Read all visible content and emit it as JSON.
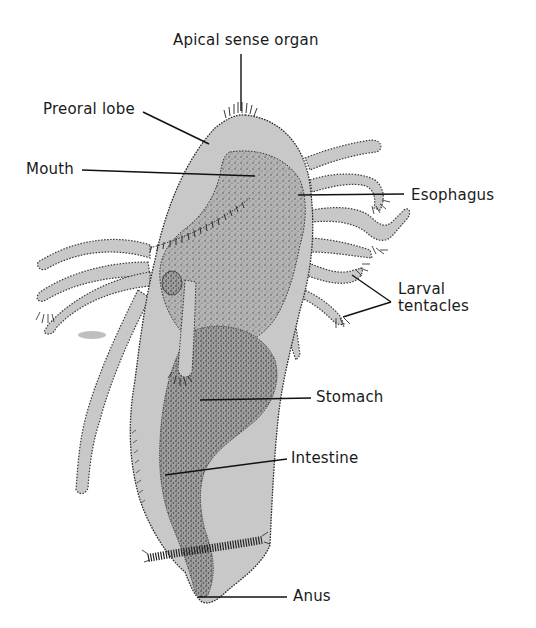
{
  "diagram": {
    "labels": {
      "apical_sense_organ": "Apical sense organ",
      "preoral_lobe": "Preoral lobe",
      "mouth": "Mouth",
      "esophagus": "Esophagus",
      "larval_tentacles_line1": "Larval",
      "larval_tentacles_line2": "tentacles",
      "stomach": "Stomach",
      "intestine": "Intestine",
      "anus": "Anus"
    },
    "colors": {
      "background": "#ffffff",
      "body_fill": "#c8c8c8",
      "gut_fill": "#a9a9a9",
      "outline": "#2a2a2a",
      "leader_line": "#111111",
      "text": "#1a1a1a"
    }
  }
}
